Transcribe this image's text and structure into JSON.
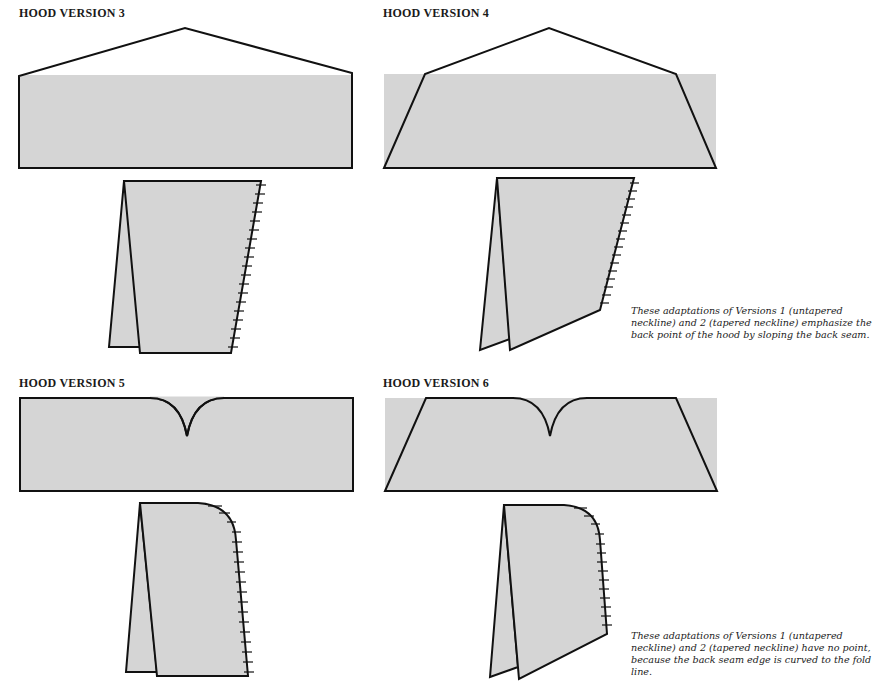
{
  "colors": {
    "fill": "#d5d5d5",
    "stroke": "#111111",
    "background": "#ffffff"
  },
  "versions": [
    {
      "id": 3,
      "title": "HOOD VERSION 3",
      "neckline": "untapered",
      "back": "pointed"
    },
    {
      "id": 4,
      "title": "HOOD VERSION 4",
      "neckline": "tapered",
      "back": "pointed"
    },
    {
      "id": 5,
      "title": "HOOD VERSION 5",
      "neckline": "untapered",
      "back": "curved"
    },
    {
      "id": 6,
      "title": "HOOD VERSION 6",
      "neckline": "tapered",
      "back": "curved"
    }
  ],
  "captions": {
    "pointed": "These adaptations of Versions 1 (untapered neckline) and 2 (tapered neckline) emphasize the back point of the hood by sloping the back seam.",
    "curved": "These adaptations of Versions 1 (untapered neckline) and 2 (tapered neckline) have no point, because the back seam edge is curved to the fold line."
  }
}
